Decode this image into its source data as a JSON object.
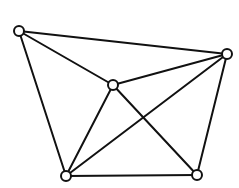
{
  "diagram": {
    "type": "graph",
    "directed": false,
    "colors": {
      "background": "#ffffff",
      "stroke": "#111111",
      "node_fill": "#ffffff"
    },
    "node_radius": 5,
    "nodes": [
      {
        "id": "top-left",
        "x": 19,
        "y": 31
      },
      {
        "id": "right",
        "x": 227,
        "y": 54
      },
      {
        "id": "center",
        "x": 113,
        "y": 85
      },
      {
        "id": "bottom-left",
        "x": 66,
        "y": 176
      },
      {
        "id": "bottom-right",
        "x": 197,
        "y": 175
      }
    ],
    "edges": [
      {
        "from": "top-left",
        "to": "right"
      },
      {
        "from": "top-left",
        "to": "center"
      },
      {
        "from": "top-left",
        "to": "bottom-left"
      },
      {
        "from": "center",
        "to": "right"
      },
      {
        "from": "center",
        "to": "bottom-left"
      },
      {
        "from": "center",
        "to": "bottom-right"
      },
      {
        "from": "right",
        "to": "bottom-left"
      },
      {
        "from": "right",
        "to": "bottom-right"
      },
      {
        "from": "bottom-left",
        "to": "bottom-right"
      }
    ]
  }
}
